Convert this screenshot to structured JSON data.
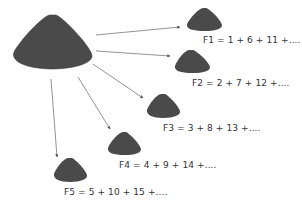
{
  "diagram": {
    "colors": {
      "cone": "#4a4a4a",
      "cone_edge": "#3a3a3a",
      "arrow": "#777777",
      "text": "#333333"
    },
    "source": {
      "name": "big-cone",
      "icon": "cone-shape"
    },
    "targets": [
      {
        "id": "F1",
        "label": "F1 = 1 + 6 + 11 +...."
      },
      {
        "id": "F2",
        "label": "F2 = 2 + 7 + 12 +...."
      },
      {
        "id": "F3",
        "label": "F3 = 3 + 8 + 13 +...."
      },
      {
        "id": "F4",
        "label": "F4 = 4 + 9 + 14 +...."
      },
      {
        "id": "F5",
        "label": "F5 = 5 + 10 + 15 +...."
      }
    ]
  }
}
